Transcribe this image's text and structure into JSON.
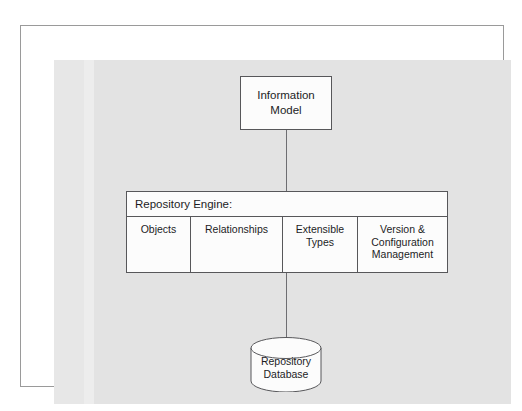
{
  "diagram": {
    "colors": {
      "page_background": "#ffffff",
      "panel_gray": "#e3e3e3",
      "panel_band": "#ededed",
      "box_fill": "#fcfcfc",
      "box_stroke": "#57575a",
      "connector": "#6e6e72",
      "text": "#1d1d1f"
    },
    "information_model": {
      "line1": "Information",
      "line2": "Model"
    },
    "repository_engine": {
      "header": "Repository Engine:",
      "columns": [
        {
          "line1": "Objects",
          "line2": ""
        },
        {
          "line1": "Relationships",
          "line2": ""
        },
        {
          "line1": "Extensible",
          "line2": "Types"
        },
        {
          "line1": "Version &",
          "line2": "Configuration",
          "line3": "Management"
        }
      ]
    },
    "repository_database": {
      "line1": "Repository",
      "line2": "Database"
    }
  }
}
